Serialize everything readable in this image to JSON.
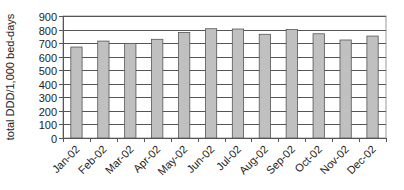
{
  "chart_data": {
    "type": "bar",
    "title": "",
    "xlabel": "",
    "ylabel": "total DDD/1,000 bed-days",
    "ylim": [
      0,
      900
    ],
    "yticks": [
      0,
      100,
      200,
      300,
      400,
      500,
      600,
      700,
      800,
      900
    ],
    "grid": true,
    "legend": null,
    "categories": [
      "Jan-02",
      "Feb-02",
      "Mar-02",
      "Apr-02",
      "May-02",
      "Jun-02",
      "Jul-02",
      "Aug-02",
      "Sep-02",
      "Oct-02",
      "Nov-02",
      "Dec-02"
    ],
    "values": [
      671,
      715,
      698,
      728,
      779,
      806,
      804,
      765,
      801,
      769,
      723,
      752
    ],
    "bar_color": "#c0c0c0",
    "bar_edge_color": "#555555"
  }
}
